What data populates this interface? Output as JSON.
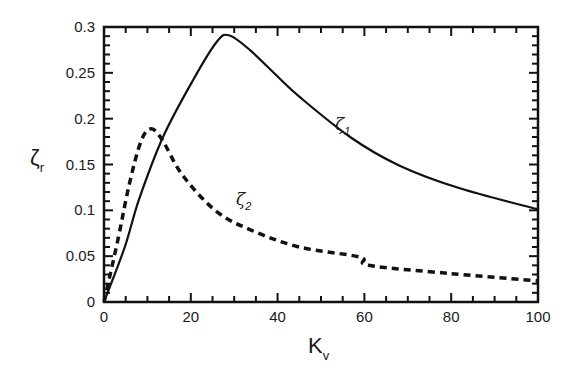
{
  "chart_data": {
    "type": "line",
    "title": "",
    "xlabel": "K",
    "xlabel_sub": "v",
    "ylabel": "ζ",
    "ylabel_sub": "r",
    "xlim": [
      0,
      100
    ],
    "ylim": [
      0,
      0.3
    ],
    "grid": false,
    "legend": "none (inline curve labels)",
    "x_ticks": [
      0,
      20,
      40,
      60,
      80,
      100
    ],
    "x_tick_labels": [
      "0",
      "20",
      "40",
      "60",
      "80",
      "100"
    ],
    "x_minor_step": 5,
    "y_ticks": [
      0,
      0.05,
      0.1,
      0.15,
      0.2,
      0.25,
      0.3
    ],
    "y_tick_labels": [
      "0",
      "0.05",
      "0.1",
      "0.15",
      "0.2",
      "0.25",
      "0.3"
    ],
    "y_minor_step": 0.01,
    "series": [
      {
        "name": "ζ1",
        "label": "ζ",
        "label_sub": "1",
        "style": "solid",
        "color": "#111111",
        "x": [
          0,
          4.8,
          8,
          13.6,
          20.5,
          26,
          28.8,
          33.6,
          40,
          45,
          56.7,
          68,
          82,
          100
        ],
        "values": [
          0,
          0.06,
          0.111,
          0.18,
          0.242,
          0.284,
          0.291,
          0.275,
          0.246,
          0.224,
          0.18,
          0.149,
          0.124,
          0.101
        ]
      },
      {
        "name": "ζ2",
        "label": "ζ",
        "label_sub": "2",
        "style": "dashed",
        "color": "#111111",
        "x": [
          0,
          3.3,
          5.8,
          8.5,
          10.8,
          13.4,
          18,
          25.6,
          33.6,
          45,
          59,
          61,
          80,
          100
        ],
        "values": [
          0,
          0.07,
          0.128,
          0.175,
          0.189,
          0.177,
          0.139,
          0.1,
          0.079,
          0.06,
          0.049,
          0.04,
          0.031,
          0.023
        ]
      }
    ],
    "annotations": [
      {
        "text": "ζ1",
        "x": 55,
        "y": 0.195
      },
      {
        "text": "ζ2",
        "x": 32,
        "y": 0.113
      }
    ]
  }
}
